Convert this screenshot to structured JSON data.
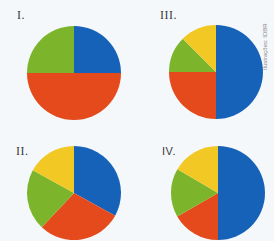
{
  "colors": {
    "blue": "#1662b8",
    "orange": "#e44a1b",
    "green": "#7cb52b",
    "yellow": "#f1c824",
    "background": "#f5f8fa"
  },
  "credit": "Ilustrações: IDBR",
  "chart_data": [
    {
      "type": "pie",
      "title": "I.",
      "categories": [
        "blue",
        "orange",
        "green"
      ],
      "values": [
        25,
        50,
        25
      ],
      "start_angle": "12 o'clock, clockwise"
    },
    {
      "type": "pie",
      "title": "III.",
      "categories": [
        "blue",
        "orange",
        "green",
        "yellow"
      ],
      "values": [
        50,
        25,
        12.5,
        12.5
      ],
      "start_angle": "12 o'clock, clockwise"
    },
    {
      "type": "pie",
      "title": "II.",
      "categories": [
        "blue",
        "orange",
        "green",
        "yellow"
      ],
      "values": [
        33,
        29,
        21,
        17
      ],
      "start_angle": "12 o'clock, clockwise"
    },
    {
      "type": "pie",
      "title": "IV.",
      "categories": [
        "blue",
        "orange",
        "green",
        "yellow"
      ],
      "values": [
        50,
        16.7,
        16.7,
        16.6
      ],
      "start_angle": "12 o'clock, clockwise"
    }
  ]
}
